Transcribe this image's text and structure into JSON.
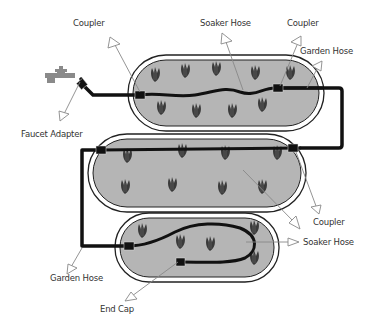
{
  "diagram": {
    "colors": {
      "bed_fill": "#b5b5b5",
      "bed_border": "#222222",
      "hose": "#111111",
      "plant": "#3a3a3a",
      "faucet": "#8a8a8a",
      "arrow_stroke": "#888888",
      "label_text": "#333333"
    },
    "labels": {
      "coupler_top_left": "Coupler",
      "soaker_hose_top": "Soaker Hose",
      "coupler_top_right": "Coupler",
      "garden_hose_top_right": "Garden Hose",
      "faucet_adapter": "Faucet Adapter",
      "coupler_middle_right": "Coupler",
      "soaker_hose_bottom_right": "Soaker Hose",
      "garden_hose_bottom_left": "Garden Hose",
      "end_cap": "End Cap"
    },
    "beds": [
      {
        "name": "top-bed",
        "plants": 9
      },
      {
        "name": "middle-bed",
        "plants": 8
      },
      {
        "name": "bottom-bed",
        "plants": 7
      }
    ]
  }
}
